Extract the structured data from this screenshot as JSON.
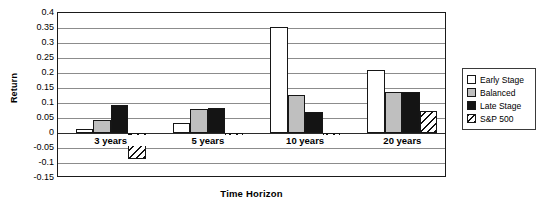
{
  "chart_data": {
    "type": "bar",
    "title": "",
    "xlabel": "Time Horizon",
    "ylabel": "Return",
    "categories": [
      "3 years",
      "5 years",
      "10 years",
      "20 years"
    ],
    "series": [
      {
        "name": "Early Stage",
        "color": "#ffffff",
        "values": [
          0.015,
          0.033,
          0.355,
          0.211
        ]
      },
      {
        "name": "Balanced",
        "color": "#bfbfbf",
        "values": [
          0.045,
          0.08,
          0.128,
          0.137
        ]
      },
      {
        "name": "Late Stage",
        "color": "#141414",
        "values": [
          0.092,
          0.083,
          0.069,
          0.136
        ]
      },
      {
        "name": "S&P 500",
        "color": "hatched",
        "values": [
          -0.085,
          -0.021,
          -0.019,
          0.074
        ]
      }
    ],
    "ylim": [
      -0.15,
      0.4
    ],
    "yticks": [
      0.4,
      0.35,
      0.3,
      0.25,
      0.2,
      0.15,
      0.1,
      0.05,
      0,
      -0.05,
      -0.1,
      -0.15
    ],
    "ytick_labels": [
      "0.4",
      "0.35",
      "0.3",
      "0.25",
      "0.2",
      "0.15",
      "0.1",
      "0.05",
      "0",
      "-0.05",
      "-0.1",
      "-0.15"
    ],
    "grid": true,
    "legend_position": "right"
  },
  "legend": {
    "items": [
      {
        "label": "Early Stage"
      },
      {
        "label": "Balanced"
      },
      {
        "label": "Late Stage"
      },
      {
        "label": "S&P 500"
      }
    ]
  }
}
